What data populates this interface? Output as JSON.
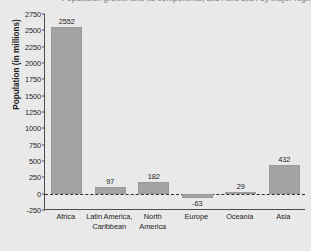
{
  "chart_data": {
    "type": "bar",
    "title": "Population growth and its components, 2024 and 2024 by major region",
    "xlabel": "",
    "ylabel": "Population (in millions)",
    "categories": [
      "Africa",
      "Latin America, Caribbean",
      "North America",
      "Europe",
      "Oceania",
      "Asia"
    ],
    "category_lines": [
      [
        "Africa"
      ],
      [
        "Latin America,",
        "Caribbean"
      ],
      [
        "North",
        "America"
      ],
      [
        "Europe"
      ],
      [
        "Oceania"
      ],
      [
        "Asia"
      ]
    ],
    "values": [
      2552,
      97,
      182,
      -63,
      29,
      432
    ],
    "value_labels": [
      "2552",
      "97",
      "182",
      "-63",
      "29",
      "432"
    ],
    "ylim": [
      -250,
      2750
    ],
    "yticks": [
      2750,
      2500,
      2250,
      2000,
      1750,
      1500,
      1250,
      1000,
      750,
      500,
      250,
      0,
      -250
    ],
    "ytick_labels": [
      "2750",
      "2500",
      "2250",
      "2000",
      "1750",
      "1500",
      "1250",
      "1000",
      "750",
      "500",
      "250",
      "0",
      "-250"
    ],
    "grid": false,
    "legend": null,
    "zero_line": true,
    "bar_color": "#a3a3a3",
    "background_color": "#e9e9e9",
    "axis_color": "#4d4d4d"
  }
}
